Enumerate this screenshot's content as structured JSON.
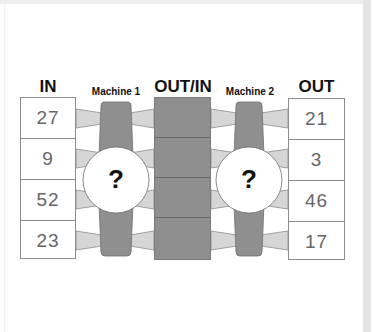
{
  "headers": {
    "in": "IN",
    "machine1": "Machine 1",
    "out_in": "OUT/IN",
    "machine2": "Machine 2",
    "out": "OUT"
  },
  "in_values": [
    "27",
    "9",
    "52",
    "23"
  ],
  "out_values": [
    "21",
    "3",
    "46",
    "17"
  ],
  "machines": [
    {
      "label": "Machine 1",
      "unknown": "?"
    },
    {
      "label": "Machine 2",
      "unknown": "?"
    }
  ],
  "colors": {
    "machine_body": "#8f8f8f",
    "connector": "#d6d6d6",
    "middle_column": "#8f8f8f",
    "border": "#8c8c8c"
  }
}
